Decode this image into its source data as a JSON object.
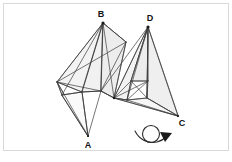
{
  "figure": {
    "background_color": "#ffffff",
    "border_color": "#d9d9d9",
    "line_color": "#3c3c3c",
    "face_fill_color": "#f2f2f2",
    "label_color": "#121212",
    "labels": [
      {
        "id": "A",
        "text": "A",
        "x": 87,
        "y": 146
      },
      {
        "id": "B",
        "text": "B",
        "x": 102,
        "y": 16
      },
      {
        "id": "C",
        "text": "C",
        "x": 180,
        "y": 124
      },
      {
        "id": "D",
        "text": "D",
        "x": 150,
        "y": 20
      }
    ],
    "vertices": {
      "A": {
        "x": 88,
        "y": 136
      },
      "B": {
        "x": 103,
        "y": 23
      },
      "C": {
        "x": 178,
        "y": 116
      },
      "D": {
        "x": 148,
        "y": 27
      },
      "L1": {
        "x": 57,
        "y": 82
      },
      "L2": {
        "x": 62,
        "y": 95
      },
      "L3": {
        "x": 82,
        "y": 92
      },
      "L4": {
        "x": 101,
        "y": 91
      },
      "L5": {
        "x": 126,
        "y": 42
      },
      "R1": {
        "x": 114,
        "y": 98
      },
      "R2": {
        "x": 131,
        "y": 81
      },
      "R3": {
        "x": 148,
        "y": 81
      },
      "R4": {
        "x": 147,
        "y": 98
      },
      "R5": {
        "x": 127,
        "y": 100
      }
    },
    "rotation_symbol": {
      "name": "rotation-arrow",
      "circle": {
        "cx": 151,
        "cy": 135,
        "r": 9
      },
      "arrowhead": {
        "x": 167,
        "y": 137
      }
    }
  }
}
